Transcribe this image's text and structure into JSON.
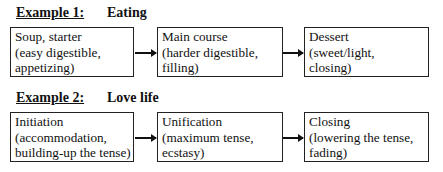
{
  "examples": [
    {
      "label": "Example 1:",
      "title": "Eating",
      "steps": [
        {
          "lines": [
            "Soup, starter",
            "(easy digestible,",
            "appetizing)"
          ]
        },
        {
          "lines": [
            "Main course",
            "(harder digestible,",
            "filling)"
          ]
        },
        {
          "lines": [
            "Dessert",
            "(sweet/light,",
            "closing)"
          ]
        }
      ]
    },
    {
      "label": "Example 2:",
      "title": "Love life",
      "steps": [
        {
          "lines": [
            "Initiation",
            "(accommodation,",
            "building-up the tense)"
          ]
        },
        {
          "lines": [
            "Unification",
            "(maximum tense,",
            "ecstasy)"
          ]
        },
        {
          "lines": [
            "Closing",
            "(lowering the tense,",
            "fading)"
          ]
        }
      ]
    }
  ]
}
